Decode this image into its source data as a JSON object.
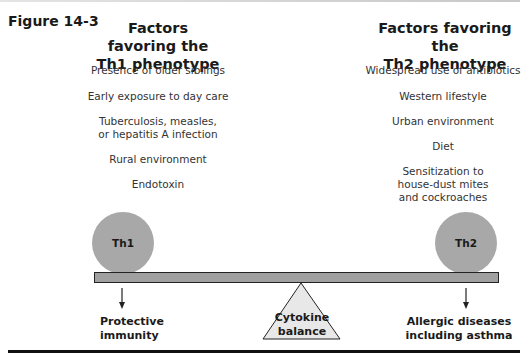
{
  "figure": {
    "label": "Figure 14-3"
  },
  "th1_column": {
    "title": "Factors favoring the\nTh1 phenotype",
    "factors": [
      "Presence of older siblings",
      "Early exposure to day care",
      "Tuberculosis, measles,\nor hepatitis A infection",
      "Rural environment",
      "Endotoxin"
    ]
  },
  "th2_column": {
    "title": "Factors favoring the\nTh2 phenotype",
    "factors": [
      "Widespread use of antibiotics",
      "Western lifestyle",
      "Urban environment",
      "Diet",
      "Sensitization to\nhouse-dust mites\nand cockroaches"
    ]
  },
  "balance": {
    "left_weight": "Th1",
    "right_weight": "Th2",
    "fulcrum": "Cytokine\nbalance",
    "left_outcome": "Protective\nimmunity",
    "right_outcome": "Allergic diseases\nincluding asthma"
  },
  "colors": {
    "circle_fill": "#a8a8a8",
    "bar_fill": "#a0a0a0",
    "triangle_fill": "#e8e8e8",
    "outline": "#222222"
  }
}
